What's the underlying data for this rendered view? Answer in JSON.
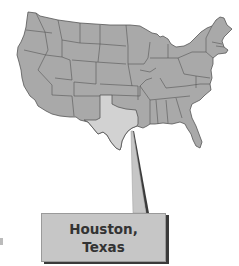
{
  "figure": {
    "highlighted_state": "Texas",
    "callout": {
      "line1": "Houston,",
      "line2": "Texas"
    }
  },
  "colors": {
    "states_fill": "#a9a9a9",
    "highlight_fill": "#d2d2d2",
    "border": "#555555",
    "callout_fill": "#c6c6c6",
    "callout_shadow": "#3a3a3a",
    "text": "#333333"
  }
}
